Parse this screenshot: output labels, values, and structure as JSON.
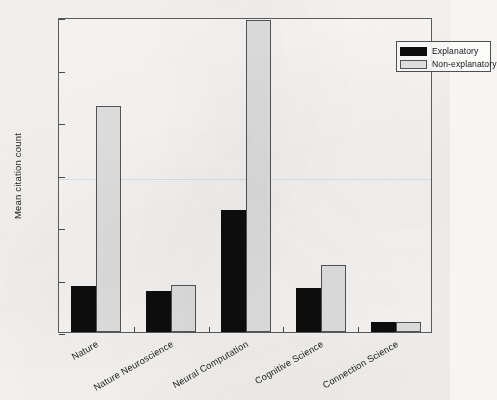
{
  "chart_data": {
    "type": "bar",
    "title": "",
    "xlabel": "",
    "ylabel": "Mean citation count",
    "ylim": [
      0,
      600
    ],
    "yticks": [
      0,
      100,
      200,
      300,
      400,
      500,
      600
    ],
    "grid": false,
    "legend_position": "top-right",
    "categories": [
      "Nature",
      "Nature Neuroscience",
      "Neural Computation",
      "Cognitive Science",
      "Connection Science"
    ],
    "series": [
      {
        "name": "Explanatory",
        "color": "#0d0d0d",
        "values": [
          88,
          79,
          233,
          83,
          19
        ]
      },
      {
        "name": "Non-explanatory",
        "color": "#e2e2e2",
        "values": [
          430,
          90,
          595,
          128,
          20
        ]
      }
    ]
  },
  "legend": {
    "items": [
      {
        "label": "Explanatory",
        "swatch": "explanatory"
      },
      {
        "label": "Non-explanatory",
        "swatch": "nonexplanatory"
      }
    ]
  },
  "axes": {
    "y_title": "Mean citation count",
    "y_tick_labels": [
      "0",
      "100",
      "200",
      "300",
      "400",
      "500",
      "600"
    ]
  }
}
